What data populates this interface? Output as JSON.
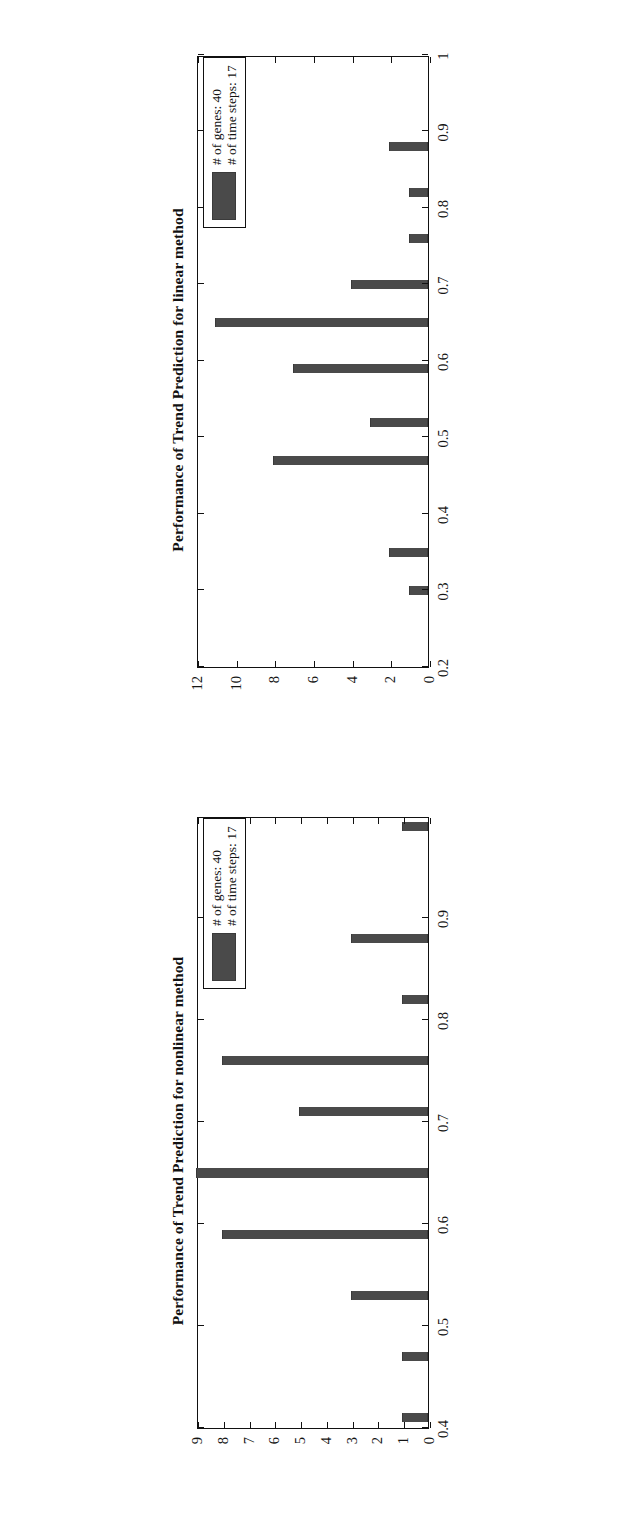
{
  "figure": {
    "orientation": "rotated-90-ccw",
    "panel_count": 2,
    "bar_color": "#4a4a4a",
    "axis_color": "#111111"
  },
  "charts": [
    {
      "panel": "top",
      "title": "Performance of Trend Prediction for linear method",
      "legend": {
        "line1": "# of genes: 40",
        "line2": "# of time steps: 17",
        "swatch_color": "#4a4a4a"
      },
      "xticks": [
        "0.2",
        "0.3",
        "0.4",
        "0.5",
        "0.6",
        "0.7",
        "0.8",
        "0.9",
        "1"
      ],
      "yticks": [
        "0",
        "2",
        "4",
        "6",
        "8",
        "10",
        "12"
      ]
    },
    {
      "panel": "bottom",
      "title": "Performance of Trend Prediction for nonlinear method",
      "legend": {
        "line1": "# of genes: 40",
        "line2": "# of time steps: 17",
        "swatch_color": "#4a4a4a"
      },
      "xticks": [
        "0.4",
        "0.5",
        "0.6",
        "0.7",
        "0.8",
        "0.9"
      ],
      "yticks": [
        "0",
        "1",
        "2",
        "3",
        "4",
        "5",
        "6",
        "7",
        "8",
        "9"
      ]
    }
  ],
  "chart_data": [
    {
      "type": "bar",
      "title": "Performance of Trend Prediction for linear method",
      "xlabel": "",
      "ylabel": "",
      "orientation": "vertical",
      "xlim": [
        0.2,
        1.0
      ],
      "ylim": [
        0,
        12
      ],
      "grid": false,
      "legend_position": "top-right",
      "legend_entries": [
        "# of genes: 40",
        "# of time steps: 17"
      ],
      "xticks": [
        0.2,
        0.3,
        0.4,
        0.5,
        0.6,
        0.7,
        0.8,
        0.9,
        1.0
      ],
      "yticks": [
        0,
        2,
        4,
        6,
        8,
        10,
        12
      ],
      "x": [
        0.3,
        0.35,
        0.47,
        0.52,
        0.59,
        0.65,
        0.7,
        0.76,
        0.82,
        0.88
      ],
      "values": [
        1,
        2,
        8,
        3,
        7,
        11,
        4,
        1,
        1,
        2
      ],
      "bar_width": 0.012
    },
    {
      "type": "bar",
      "title": "Performance of Trend Prediction for nonlinear method",
      "xlabel": "",
      "ylabel": "",
      "orientation": "vertical",
      "xlim": [
        0.4,
        1.0
      ],
      "ylim": [
        0,
        9
      ],
      "grid": false,
      "legend_position": "top-right",
      "legend_entries": [
        "# of genes: 40",
        "# of time steps: 17"
      ],
      "xticks": [
        0.4,
        0.5,
        0.6,
        0.7,
        0.8,
        0.9
      ],
      "yticks": [
        0,
        1,
        2,
        3,
        4,
        5,
        6,
        7,
        8,
        9
      ],
      "x": [
        0.41,
        0.47,
        0.53,
        0.59,
        0.65,
        0.71,
        0.76,
        0.82,
        0.88,
        0.99
      ],
      "values": [
        1,
        1,
        3,
        8,
        9,
        5,
        8,
        1,
        3,
        1
      ],
      "bar_width": 0.009
    }
  ]
}
